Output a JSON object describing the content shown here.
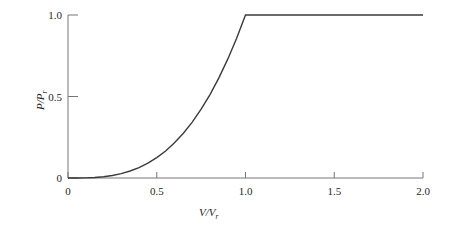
{
  "chart_data": {
    "type": "line",
    "title": "",
    "xlabel": "V/Vᵣ",
    "ylabel": "P/Pᵣ",
    "xlabel_main": "V/V",
    "xlabel_sub": "r",
    "ylabel_main": "P/P",
    "ylabel_sub": "r",
    "xlim": [
      0,
      2.0
    ],
    "ylim": [
      0,
      1.0
    ],
    "xticks": [
      0,
      0.5,
      1.0,
      1.5,
      2.0
    ],
    "xtick_labels": [
      "0",
      "0.5",
      "1.0",
      "1.5",
      "2.0"
    ],
    "yticks": [
      0,
      0.5,
      1.0
    ],
    "ytick_labels": [
      "0",
      "0.5",
      "1.0"
    ],
    "grid": false,
    "legend": false,
    "line_color": "#3b3b3b",
    "axis_color": "#767676",
    "text_color": "#262626",
    "series": [
      {
        "name": "power-curve",
        "x": [
          0.0,
          0.05,
          0.1,
          0.15,
          0.2,
          0.25,
          0.3,
          0.35,
          0.4,
          0.45,
          0.5,
          0.55,
          0.6,
          0.65,
          0.7,
          0.75,
          0.8,
          0.85,
          0.9,
          0.95,
          1.0,
          1.1,
          1.2,
          1.3,
          1.4,
          1.5,
          1.6,
          1.7,
          1.8,
          1.9,
          2.0
        ],
        "y": [
          0.0,
          0.000125,
          0.001,
          0.003375,
          0.008,
          0.0156,
          0.027,
          0.0429,
          0.064,
          0.0911,
          0.125,
          0.166,
          0.216,
          0.275,
          0.343,
          0.422,
          0.512,
          0.614,
          0.729,
          0.857,
          1.0,
          1.0,
          1.0,
          1.0,
          1.0,
          1.0,
          1.0,
          1.0,
          1.0,
          1.0,
          1.0
        ]
      }
    ],
    "annotations": []
  }
}
